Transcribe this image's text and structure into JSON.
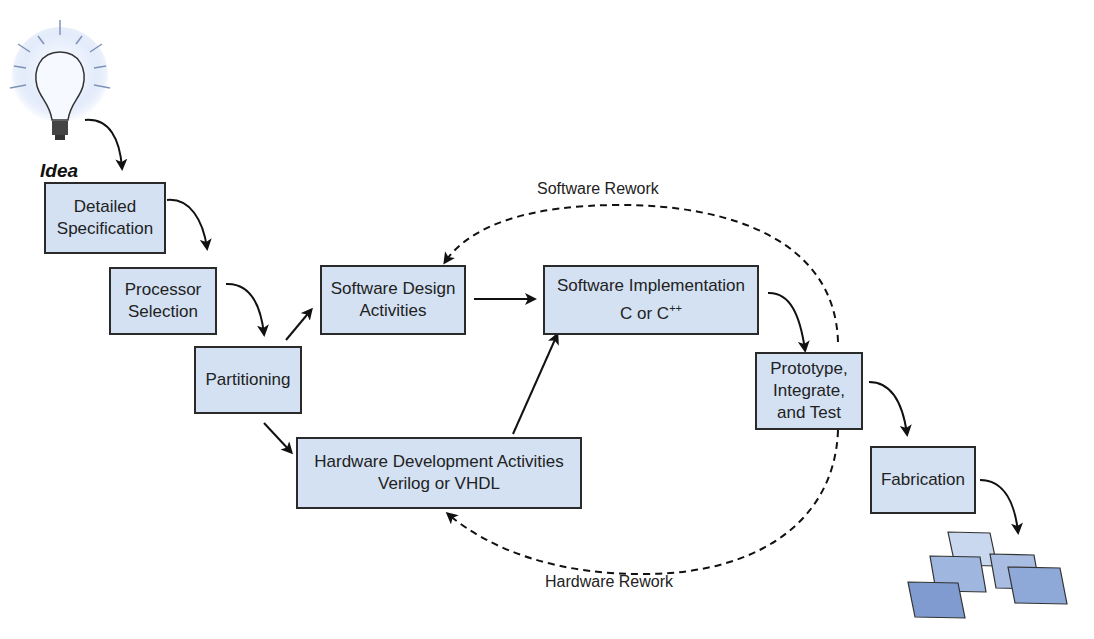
{
  "diagram": {
    "idea_label": "Idea",
    "boxes": {
      "detailed_spec": {
        "line1": "Detailed",
        "line2": "Specification"
      },
      "processor_selection": {
        "line1": "Processor",
        "line2": "Selection"
      },
      "partitioning": {
        "line1": "Partitioning"
      },
      "software_design": {
        "line1": "Software Design",
        "line2": "Activities"
      },
      "software_impl": {
        "line1": "Software Implementation",
        "line2_prefix": "C or C",
        "line2_sup": "++"
      },
      "hardware_dev": {
        "line1": "Hardware Development Activities",
        "line2": "Verilog or VHDL"
      },
      "prototype": {
        "line1": "Prototype,",
        "line2": "Integrate,",
        "line3": "and Test"
      },
      "fabrication": {
        "line1": "Fabrication"
      }
    },
    "loop_labels": {
      "software_rework": "Software Rework",
      "hardware_rework": "Hardware Rework"
    },
    "colors": {
      "box_fill": "#d3e1f3",
      "box_border": "#2a2a2a",
      "chip_light": "#c9d8ee",
      "chip_mid": "#9fb6de",
      "chip_dark": "#7f9bcf"
    }
  }
}
